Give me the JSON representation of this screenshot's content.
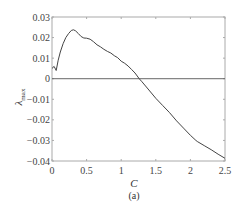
{
  "chart_data": {
    "type": "line",
    "title": "",
    "caption": "(a)",
    "xlabel": "C",
    "ylabel": "λmax",
    "ylabel_main": "λ",
    "ylabel_sub": "max",
    "xlim": [
      0,
      2.5
    ],
    "ylim": [
      -0.04,
      0.03
    ],
    "xticks": [
      0,
      0.5,
      1,
      1.5,
      2,
      2.5
    ],
    "xtick_labels": [
      "0",
      "0.5",
      "1",
      "1.5",
      "2",
      "2.5"
    ],
    "yticks": [
      0.03,
      0.02,
      0.01,
      0,
      -0.01,
      -0.02,
      -0.03,
      -0.04
    ],
    "ytick_labels": [
      "0.03",
      "0.02",
      "0.01",
      "0",
      "−0.01",
      "−0.02",
      "−0.03",
      "−0.04"
    ],
    "grid": false,
    "reference_line": {
      "y": 0
    },
    "series": [
      {
        "name": "λmax",
        "color": "#444444",
        "x": [
          0.0,
          0.03,
          0.06,
          0.09,
          0.12,
          0.16,
          0.2,
          0.24,
          0.28,
          0.31,
          0.34,
          0.38,
          0.42,
          0.46,
          0.5,
          0.55,
          0.6,
          0.65,
          0.7,
          0.75,
          0.8,
          0.85,
          0.9,
          0.95,
          1.0,
          1.05,
          1.1,
          1.15,
          1.2,
          1.26,
          1.3,
          1.4,
          1.5,
          1.6,
          1.7,
          1.8,
          1.9,
          2.0,
          2.08,
          2.1,
          2.2,
          2.3,
          2.4,
          2.5
        ],
        "y": [
          0.005,
          0.006,
          0.004,
          0.009,
          0.013,
          0.017,
          0.02,
          0.022,
          0.0235,
          0.0238,
          0.0233,
          0.022,
          0.0205,
          0.0198,
          0.0197,
          0.0192,
          0.018,
          0.0165,
          0.0155,
          0.0143,
          0.0133,
          0.0125,
          0.0112,
          0.0102,
          0.0085,
          0.0075,
          0.0062,
          0.0045,
          0.0028,
          0.0,
          -0.0015,
          -0.0055,
          -0.0095,
          -0.013,
          -0.0165,
          -0.0205,
          -0.024,
          -0.0275,
          -0.03,
          -0.0305,
          -0.0325,
          -0.0345,
          -0.0367,
          -0.0387
        ]
      }
    ]
  }
}
